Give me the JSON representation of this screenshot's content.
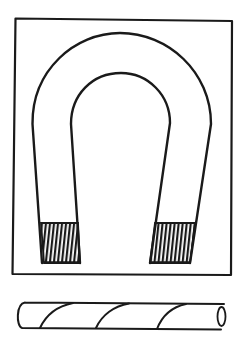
{
  "figure": {
    "title": "",
    "elements": [
      {
        "id": "frame",
        "kind": "rectangle-border"
      },
      {
        "id": "horseshoe-magnet",
        "kind": "magnet",
        "poles": [
          "left-pole",
          "right-pole"
        ],
        "pole_fill": "hatched"
      },
      {
        "id": "iron-rod",
        "kind": "cylinder",
        "marking": "spiral-stripes",
        "stripe_count": 3
      }
    ],
    "colors": {
      "ink": "#1a1a1a",
      "background": "#ffffff"
    }
  }
}
